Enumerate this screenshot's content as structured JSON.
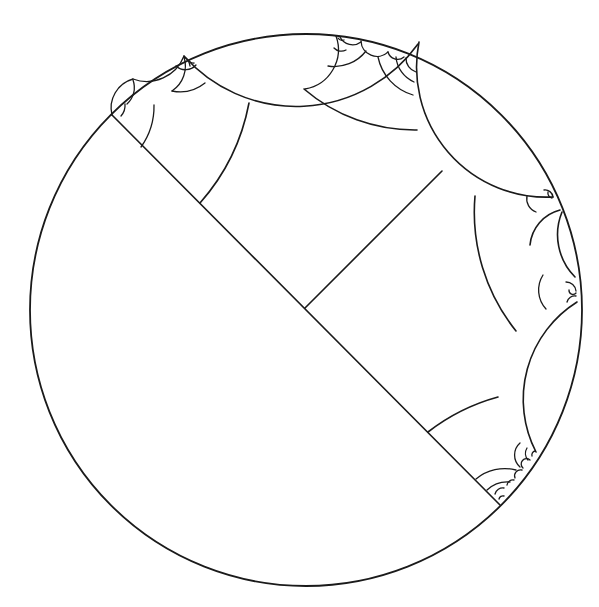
{
  "diagram": {
    "type": "hyperbolic-tiling-poincare-disk",
    "background": "#ffffff",
    "stroke_color": "#1a1a1a",
    "boundary_circle": {
      "cx": 306,
      "cy": 310,
      "r": 276
    },
    "main_diameter": {
      "x1": 112,
      "y1": 115,
      "x2": 500,
      "y2": 505
    },
    "perpendicular_segment": {
      "x1": 305,
      "y1": 308,
      "x2": 442,
      "y2": 171
    },
    "labels": []
  }
}
